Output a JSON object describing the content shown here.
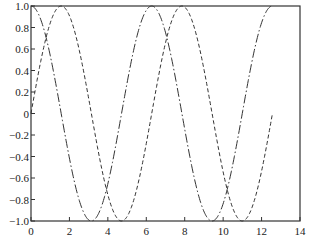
{
  "chart_data": {
    "type": "line",
    "title": "",
    "xlabel": "",
    "ylabel": "",
    "xlim": [
      0,
      14
    ],
    "ylim": [
      -1,
      1
    ],
    "grid": false,
    "legend": null,
    "x_ticks": [
      "0",
      "2",
      "4",
      "6",
      "8",
      "10",
      "12",
      "14"
    ],
    "y_ticks": [
      "1.0",
      "0.8",
      "0.6",
      "0.4",
      "0.2",
      "0",
      "-0.2",
      "-0.4",
      "-0.6",
      "-0.8",
      "-1.0"
    ],
    "x_range_of_data": [
      0,
      12.566
    ],
    "series": [
      {
        "name": "sin(x)",
        "style": "dashed",
        "color": "#333333",
        "x": [
          0,
          1.5708,
          3.1416,
          4.7124,
          6.2832,
          7.854,
          9.4248,
          10.9956,
          12.5664
        ],
        "values": [
          0,
          1,
          0,
          -1,
          0,
          1,
          0,
          -1,
          0
        ]
      },
      {
        "name": "cos(x)",
        "style": "dash-dot",
        "color": "#333333",
        "x": [
          0,
          1.5708,
          3.1416,
          4.7124,
          6.2832,
          7.854,
          9.4248,
          10.9956,
          12.5664
        ],
        "values": [
          1,
          0,
          -1,
          0,
          1,
          0,
          -1,
          0,
          1
        ]
      }
    ]
  },
  "axes": {
    "x_tick_labels": [
      "0",
      "2",
      "4",
      "6",
      "8",
      "10",
      "12",
      "14"
    ],
    "y_tick_labels": [
      "1.0",
      "0.8",
      "0.6",
      "0.4",
      "0.2",
      "0",
      "−0.2",
      "−0.4",
      "−0.6",
      "−0.8",
      "−1.0"
    ]
  }
}
